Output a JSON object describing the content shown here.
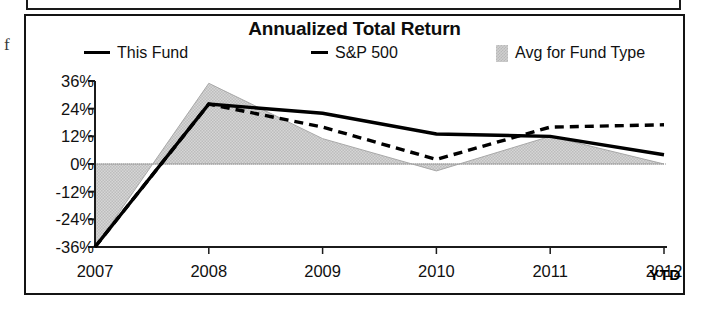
{
  "artifact": {
    "stray_glyph": "f"
  },
  "chart_panel": {
    "title": "Annualized Total Return"
  },
  "legend": {
    "items": [
      {
        "label": "This Fund",
        "marker": "solid-line-swatch",
        "color": "#000000"
      },
      {
        "label": "S&P 500",
        "marker": "dashed-line-swatch",
        "color": "#000000"
      },
      {
        "label": "Avg for Fund Type",
        "marker": "shaded-area-swatch",
        "color": "#cfcfcf"
      }
    ]
  },
  "axes": {
    "y_ticks": [
      "36%",
      "24%",
      "12%",
      "0%",
      "-12%",
      "-24%",
      "-36%"
    ],
    "x_ticks": [
      "2007",
      "2008",
      "2009",
      "2010",
      "2011",
      "2012"
    ],
    "x_suffix": "YTD"
  },
  "chart_data": {
    "type": "line",
    "title": "Annualized Total Return",
    "xlabel": "",
    "ylabel": "",
    "x": [
      "2007",
      "2008",
      "2009",
      "2010",
      "2011",
      "2012"
    ],
    "ylim": [
      -36,
      36
    ],
    "ytick_values": [
      36,
      24,
      12,
      0,
      -12,
      -24,
      -36
    ],
    "grid": false,
    "zero_line": true,
    "legend_position": "top",
    "series": [
      {
        "name": "This Fund",
        "style": "solid",
        "color": "#000000",
        "values": [
          -36,
          26,
          22,
          13,
          12,
          4
        ]
      },
      {
        "name": "S&P 500",
        "style": "dashed",
        "color": "#000000",
        "values": [
          -36,
          26,
          16,
          2,
          16,
          17
        ]
      },
      {
        "name": "Avg for Fund Type",
        "style": "area",
        "color": "#cfcfcf",
        "values": [
          -36,
          35,
          11,
          -3,
          12,
          0
        ]
      }
    ],
    "annotations": [
      "YTD"
    ]
  }
}
